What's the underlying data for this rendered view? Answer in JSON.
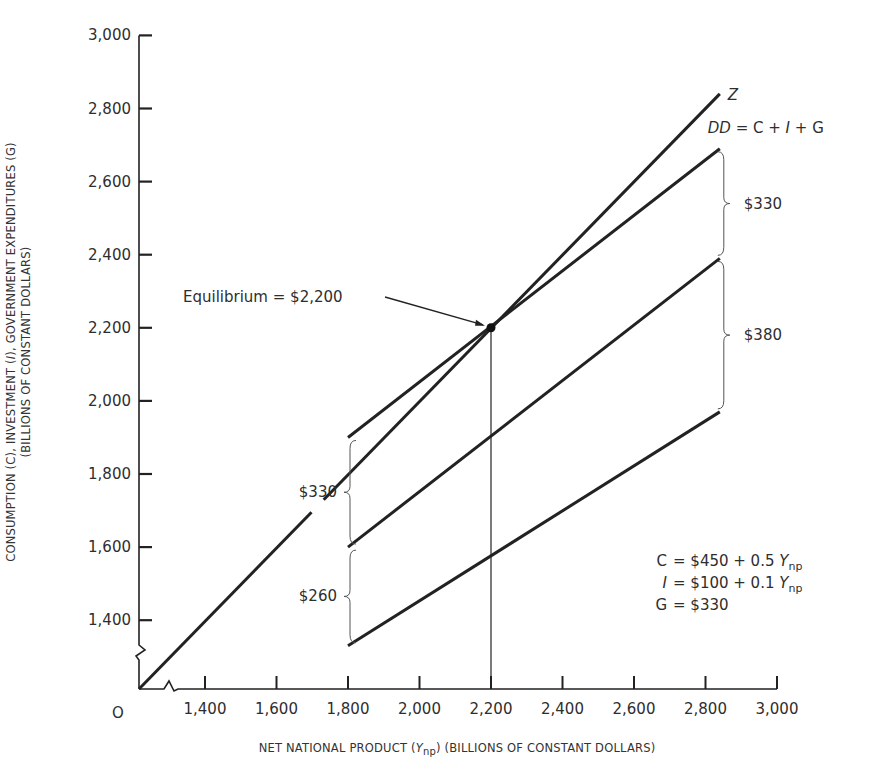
{
  "chart_data": {
    "type": "line",
    "title": "",
    "xlabel": "NET NATIONAL PRODUCT (Y_np) (BILLIONS OF CONSTANT DOLLARS)",
    "ylabel_line1": "CONSUMPTION (C), INVESTMENT (I), GOVERNMENT EXPENDITURES (G)",
    "ylabel_line2": "(BILLIONS OF CONSTANT DOLLARS)",
    "origin_label": "O",
    "x_ticks": [
      1400,
      1600,
      1800,
      2000,
      2200,
      2400,
      2600,
      2800,
      3000
    ],
    "x_tick_labels": [
      "1,400",
      "1,600",
      "1,800",
      "2,000",
      "2,200",
      "2,400",
      "2,600",
      "2,800",
      "3,000"
    ],
    "y_ticks": [
      1400,
      1600,
      1800,
      2000,
      2200,
      2400,
      2600,
      2800,
      3000
    ],
    "y_tick_labels": [
      "1,400",
      "1,600",
      "1,800",
      "2,000",
      "2,200",
      "2,400",
      "2,600",
      "2,800",
      "3,000"
    ],
    "xlim": [
      1200,
      3000
    ],
    "ylim": [
      1200,
      3000
    ],
    "axis_breaks": true,
    "grid": false,
    "series": [
      {
        "name": "Z (45° line)",
        "label": "Z",
        "x": [
          1200,
          2840
        ],
        "values": [
          1200,
          2840
        ]
      },
      {
        "name": "DD = C + I + G",
        "label": "DD = C + I + G",
        "x": [
          1800,
          2840
        ],
        "values": [
          1900,
          2690
        ]
      },
      {
        "name": "C + I",
        "label": "",
        "x": [
          1800,
          2840
        ],
        "values": [
          1600,
          2390
        ]
      },
      {
        "name": "C",
        "label": "",
        "x": [
          1800,
          2840
        ],
        "values": [
          1330,
          1970
        ]
      }
    ],
    "equilibrium": {
      "x": 2200,
      "y": 2200,
      "label": "Equilibrium = $2,200"
    },
    "brackets": [
      {
        "label": "$330",
        "side": "right",
        "x": 2840,
        "y_from": 2390,
        "y_to": 2690
      },
      {
        "label": "$380",
        "side": "right",
        "x": 2840,
        "y_from": 1970,
        "y_to": 2390
      },
      {
        "label": "$330",
        "side": "left",
        "x": 1800,
        "y_from": 1600,
        "y_to": 1900
      },
      {
        "label": "$260",
        "side": "left",
        "x": 1800,
        "y_from": 1330,
        "y_to": 1600
      }
    ],
    "equations": [
      {
        "lhs": "C",
        "rhs": "$450 + 0.5",
        "var": "Y",
        "sub": "np"
      },
      {
        "lhs": "I",
        "rhs": "$100 + 0.1",
        "var": "Y",
        "sub": "np"
      },
      {
        "lhs": "G",
        "rhs": "$330",
        "var": "",
        "sub": ""
      }
    ]
  }
}
